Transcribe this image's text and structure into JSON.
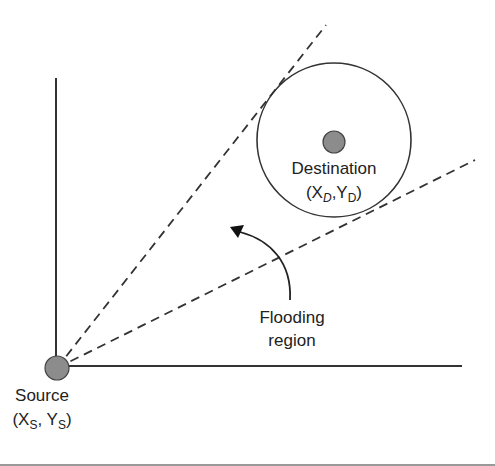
{
  "diagram": {
    "source": {
      "label": "Source",
      "coords_prefix": "(X",
      "sub1": "S",
      "sep": ", Y",
      "sub2": "S",
      "suffix": ")"
    },
    "destination": {
      "label": "Destination",
      "coords_prefix": "(X",
      "sub1": "D",
      "sep": ",Y",
      "sub2": "D",
      "suffix": ")"
    },
    "region_label_line1": "Flooding",
    "region_label_line2": "region",
    "colors": {
      "line": "#333333",
      "node_fill": "#8c8c8c",
      "node_stroke": "#444444"
    }
  }
}
